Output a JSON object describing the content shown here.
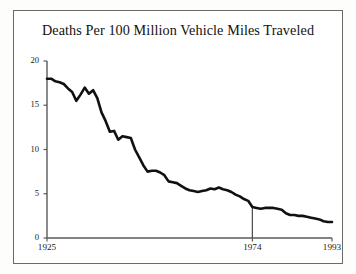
{
  "chart_data": {
    "type": "line",
    "title": "Deaths Per 100 Million Vehicle Miles Traveled",
    "xlabel": "",
    "ylabel": "",
    "xlim": [
      1925,
      1993
    ],
    "ylim": [
      0,
      20
    ],
    "grid": false,
    "legend": null,
    "line_color": "#111111",
    "x_ticks": [
      "1925",
      "1974",
      "1993"
    ],
    "x_tick_values": [
      1925,
      1974,
      1993
    ],
    "y_ticks": [
      "0",
      "5",
      "10",
      "15",
      "20"
    ],
    "y_tick_values": [
      0,
      5,
      10,
      15,
      20
    ],
    "annotations": [
      {
        "name": "marker-line-1974",
        "type": "vertical-line",
        "x": 1974,
        "y_from": 0,
        "y_to": 3.5,
        "color": "#4a4a4a"
      }
    ],
    "x": [
      1925,
      1926,
      1927,
      1928,
      1929,
      1930,
      1931,
      1932,
      1933,
      1934,
      1935,
      1936,
      1937,
      1938,
      1939,
      1940,
      1941,
      1942,
      1943,
      1944,
      1945,
      1946,
      1947,
      1948,
      1949,
      1950,
      1951,
      1952,
      1953,
      1954,
      1955,
      1956,
      1957,
      1958,
      1959,
      1960,
      1961,
      1962,
      1963,
      1964,
      1965,
      1966,
      1967,
      1968,
      1969,
      1970,
      1971,
      1972,
      1973,
      1974,
      1975,
      1976,
      1977,
      1978,
      1979,
      1980,
      1981,
      1982,
      1983,
      1984,
      1985,
      1986,
      1987,
      1988,
      1989,
      1990,
      1991,
      1992,
      1993
    ],
    "values": [
      18.0,
      18.0,
      17.7,
      17.6,
      17.4,
      16.9,
      16.5,
      15.5,
      16.2,
      17.0,
      16.3,
      16.7,
      15.8,
      14.2,
      13.2,
      12.0,
      12.1,
      11.1,
      11.5,
      11.4,
      11.3,
      10.0,
      9.1,
      8.2,
      7.5,
      7.6,
      7.6,
      7.4,
      7.1,
      6.4,
      6.3,
      6.2,
      5.9,
      5.6,
      5.4,
      5.3,
      5.2,
      5.3,
      5.4,
      5.6,
      5.5,
      5.7,
      5.5,
      5.4,
      5.2,
      4.9,
      4.7,
      4.4,
      4.2,
      3.5,
      3.4,
      3.3,
      3.4,
      3.4,
      3.4,
      3.3,
      3.2,
      2.8,
      2.6,
      2.6,
      2.5,
      2.5,
      2.4,
      2.3,
      2.2,
      2.1,
      1.9,
      1.8,
      1.8
    ]
  }
}
